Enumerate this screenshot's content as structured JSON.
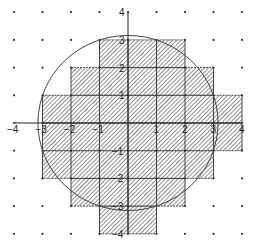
{
  "diagram": {
    "type": "lattice-square-covering-of-circle",
    "grid": {
      "x_range": [
        -4,
        4
      ],
      "y_range": [
        -4,
        4
      ],
      "spacing_units": 1,
      "dot_color": "#333333"
    },
    "axes": {
      "x_tick_labels": [
        "-4",
        "-3",
        "-2",
        "-1",
        "1",
        "2",
        "3",
        "4"
      ],
      "x_tick_values": [
        -4,
        -3,
        -2,
        -1,
        1,
        2,
        3,
        4
      ],
      "y_tick_labels": [
        "4",
        "3",
        "2",
        "1",
        "-1",
        "-2",
        "-3",
        "-4"
      ],
      "y_tick_values": [
        4,
        3,
        2,
        1,
        -1,
        -2,
        -3,
        -4
      ],
      "color": "#222222"
    },
    "circle": {
      "center": [
        0,
        0
      ],
      "radius": 3.16,
      "stroke": "#444444"
    },
    "shaded_rows": [
      {
        "y_bottom": 2,
        "x_from": -1,
        "x_to": 2
      },
      {
        "y_bottom": 1,
        "x_from": -2,
        "x_to": 3
      },
      {
        "y_bottom": 0,
        "x_from": -3,
        "x_to": 4
      },
      {
        "y_bottom": -1,
        "x_from": -3,
        "x_to": 4
      },
      {
        "y_bottom": -2,
        "x_from": -3,
        "x_to": 3
      },
      {
        "y_bottom": -3,
        "x_from": -2,
        "x_to": 2
      },
      {
        "y_bottom": -4,
        "x_from": -1,
        "x_to": 1
      }
    ],
    "hatch_color": "#555555",
    "cell_border_color": "#333333"
  }
}
